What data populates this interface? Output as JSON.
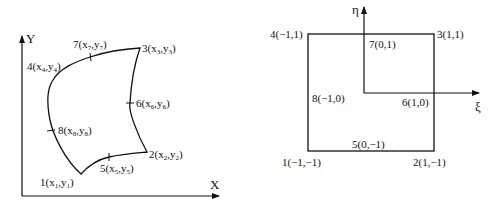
{
  "figure": {
    "left_panel": {
      "description": "Physical element (curved 8-node quadrilateral) in global x-y coordinates",
      "x_axis_label": "X",
      "y_axis_label": "Y",
      "nodes": [
        {
          "id": "1",
          "label": "1(x",
          "sub": "1",
          "mid": ",y",
          "sub2": "1",
          "end": ")"
        },
        {
          "id": "2",
          "label": "2(x",
          "sub": "2",
          "mid": ",y",
          "sub2": "2",
          "end": ")"
        },
        {
          "id": "3",
          "label": "3(x",
          "sub": "3",
          "mid": ",y",
          "sub2": "3",
          "end": ")"
        },
        {
          "id": "4",
          "label": "4(x",
          "sub": "4",
          "mid": ",y",
          "sub2": "4",
          "end": ")"
        },
        {
          "id": "5",
          "label": "5(x",
          "sub": "5",
          "mid": ",y",
          "sub2": "5",
          "end": ")"
        },
        {
          "id": "6",
          "label": "6(x",
          "sub": "6",
          "mid": ",y",
          "sub2": "6",
          "end": ")"
        },
        {
          "id": "7",
          "label": "7(x",
          "sub": "7",
          "mid": ",y",
          "sub2": "7",
          "end": ")"
        },
        {
          "id": "8",
          "label": "8(x",
          "sub": "8",
          "mid": ",y",
          "sub2": "8",
          "end": ")"
        }
      ]
    },
    "right_panel": {
      "description": "Parent (master) element in natural xi-eta coordinates",
      "xi_axis_label": "ξ",
      "eta_axis_label": "η",
      "nodes": [
        {
          "id": "1",
          "label": "1(−1,−1)"
        },
        {
          "id": "2",
          "label": "2(1,−1)"
        },
        {
          "id": "3",
          "label": "3(1,1)"
        },
        {
          "id": "4",
          "label": "4(−1,1)"
        },
        {
          "id": "5",
          "label": "5(0,−1)"
        },
        {
          "id": "6",
          "label": "6(1,0)"
        },
        {
          "id": "7",
          "label": "7(0,1)"
        },
        {
          "id": "8",
          "label": "8(−1,0)"
        }
      ]
    },
    "colors": {
      "stroke": "#111111",
      "background": "#ffffff"
    }
  }
}
